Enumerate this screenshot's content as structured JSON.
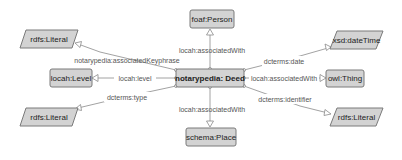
{
  "diagram": {
    "nodes": {
      "deed": {
        "label": "notarypedia: Deed",
        "shape": "class"
      },
      "person": {
        "label": "foaf:Person",
        "shape": "class"
      },
      "place": {
        "label": "schema:Place",
        "shape": "class"
      },
      "level": {
        "label": "locah:Level",
        "shape": "class"
      },
      "thing": {
        "label": "owl:Thing",
        "shape": "class"
      },
      "literal_top_left": {
        "label": "rdfs:Literal",
        "shape": "datatype"
      },
      "literal_bottom_left": {
        "label": "rdfs:Literal",
        "shape": "datatype"
      },
      "literal_right": {
        "label": "rdfs:Literal",
        "shape": "datatype"
      },
      "datetime": {
        "label": "xsd:dateTime",
        "shape": "datatype"
      }
    },
    "edges": {
      "associated_with_person": {
        "label": "locah:associatedWith",
        "from": "notarypedia: Deed",
        "to": "foaf:Person"
      },
      "associated_with_place": {
        "label": "locah:associatedWith",
        "from": "notarypedia: Deed",
        "to": "schema:Place"
      },
      "associated_with_thing": {
        "label": "locah:associatedWith",
        "from": "notarypedia: Deed",
        "to": "owl:Thing"
      },
      "level": {
        "label": "locah:level",
        "from": "notarypedia: Deed",
        "to": "locah:Level"
      },
      "keyphrase": {
        "label": "notarypedia:associatedKeyphrase",
        "from": "notarypedia: Deed",
        "to": "rdfs:Literal"
      },
      "type": {
        "label": "dcterms:type",
        "from": "notarypedia: Deed",
        "to": "rdfs:Literal"
      },
      "date": {
        "label": "dcterms:date",
        "from": "notarypedia: Deed",
        "to": "xsd:dateTime"
      },
      "identifier": {
        "label": "dcterms:identifier",
        "from": "notarypedia: Deed",
        "to": "rdfs:Literal"
      }
    },
    "colors": {
      "node_fill": "#d3d3d3",
      "node_stroke": "#7a7a7a",
      "edge": "#8a8a8a",
      "text": "#222222",
      "edge_text": "#555555"
    }
  }
}
